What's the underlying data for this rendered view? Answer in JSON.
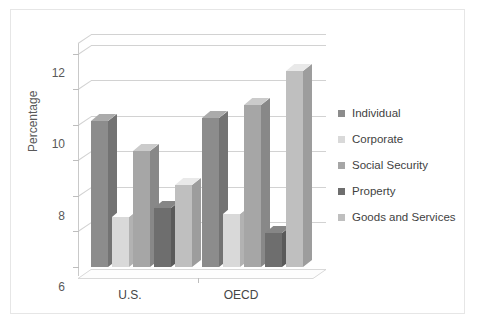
{
  "figure": {
    "title": "2010",
    "background": "#ffffff",
    "frame_color": "#e6e6e6"
  },
  "chart_data": {
    "type": "bar",
    "title": "2010",
    "xlabel": "",
    "ylabel": "Percentage",
    "categories": [
      "U.S.",
      "OECD"
    ],
    "series": [
      {
        "name": "Individual",
        "color": "#8c8c8c",
        "values": [
          8.2,
          8.4
        ]
      },
      {
        "name": "Corporate",
        "color": "#d9d9d9",
        "values": [
          2.8,
          3.0
        ]
      },
      {
        "name": "Social Security",
        "color": "#a6a6a6",
        "values": [
          6.5,
          9.1
        ]
      },
      {
        "name": "Property",
        "color": "#6e6e6e",
        "values": [
          3.3,
          1.9
        ]
      },
      {
        "name": "Goods and Services",
        "color": "#bfbfbf",
        "values": [
          4.6,
          11.0
        ]
      }
    ],
    "ylim": [
      0,
      12.6
    ],
    "yticks": [
      0,
      2,
      4,
      6,
      8,
      10,
      12
    ],
    "ytick_labels": [
      "0",
      "2",
      "4",
      "6",
      "8",
      "10",
      "12"
    ],
    "grid": true,
    "legend_position": "right",
    "style": "3d-column"
  },
  "legend": {
    "items": [
      {
        "label": "Individual",
        "color": "#8c8c8c"
      },
      {
        "label": "Corporate",
        "color": "#d9d9d9"
      },
      {
        "label": "Social Security",
        "color": "#a6a6a6"
      },
      {
        "label": "Property",
        "color": "#6e6e6e"
      },
      {
        "label": "Goods and Services",
        "color": "#bfbfbf"
      }
    ]
  },
  "axes": {
    "y_title": "Percentage",
    "y_ticks": [
      "12",
      "10",
      "8",
      "6",
      "4",
      "2",
      "0"
    ],
    "x_categories": [
      "U.S.",
      "OECD"
    ]
  }
}
